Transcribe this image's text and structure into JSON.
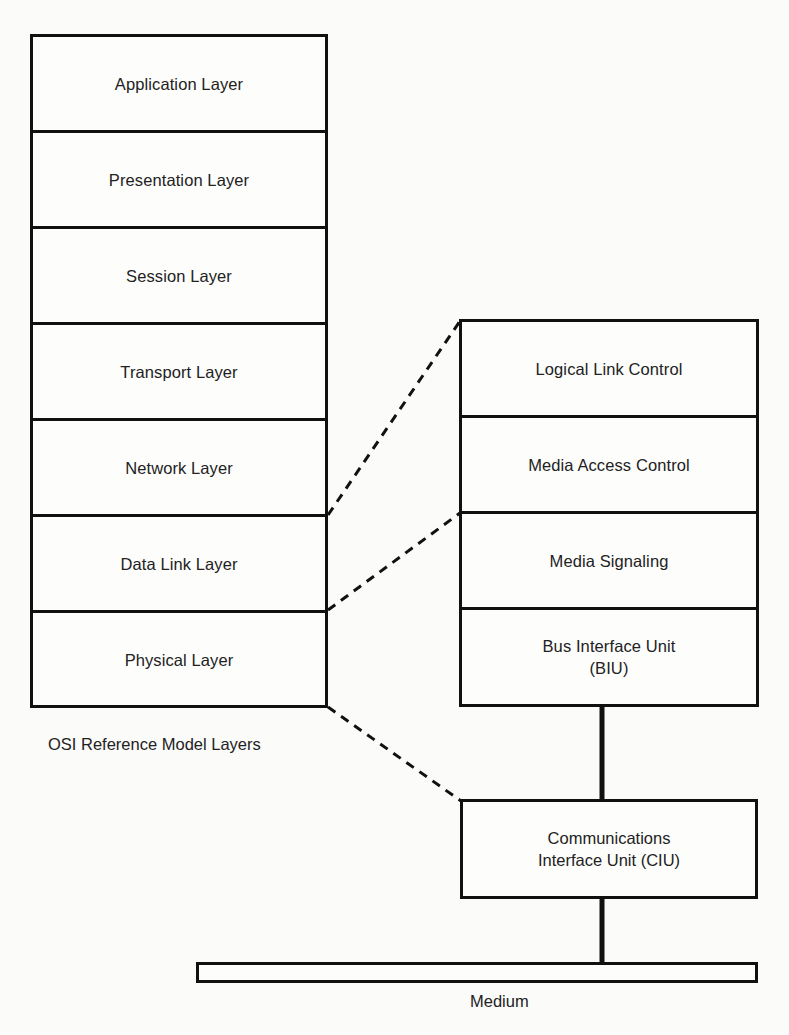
{
  "diagram": {
    "osi_stack": {
      "caption": "OSI Reference Model Layers",
      "layers": [
        {
          "label": "Application Layer"
        },
        {
          "label": "Presentation Layer"
        },
        {
          "label": "Session Layer"
        },
        {
          "label": "Transport Layer"
        },
        {
          "label": "Network Layer"
        },
        {
          "label": "Data Link Layer"
        },
        {
          "label": "Physical Layer"
        }
      ]
    },
    "lan_stack": {
      "layers": [
        {
          "label": "Logical Link Control"
        },
        {
          "label": "Media Access Control"
        },
        {
          "label": "Media Signaling"
        },
        {
          "label": "Bus Interface Unit\n(BIU)"
        }
      ]
    },
    "ciu": {
      "label": "Communications\nInterface Unit (CIU)"
    },
    "medium": {
      "label": "Medium"
    },
    "mappings": [
      {
        "from": "Data Link Layer",
        "to": "Logical Link Control + Media Access Control",
        "style": "dashed"
      },
      {
        "from": "Physical Layer",
        "to": "Media Signaling + Bus Interface Unit (BIU)",
        "style": "dashed"
      },
      {
        "from": "Physical Layer (bottom)",
        "to": "Communications Interface Unit (CIU)",
        "style": "dashed"
      }
    ],
    "links": [
      {
        "from": "Bus Interface Unit (BIU)",
        "to": "Communications Interface Unit (CIU)",
        "style": "solid-thick"
      },
      {
        "from": "Communications Interface Unit (CIU)",
        "to": "Medium",
        "style": "solid-thick"
      }
    ],
    "colors": {
      "line": "#111111",
      "text": "#222222",
      "background": "#fbfbfa"
    }
  }
}
